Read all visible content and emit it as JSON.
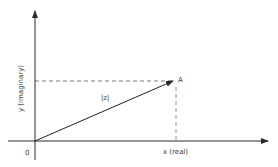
{
  "diagram": {
    "origin_label": "0",
    "x_axis_label": "x (real)",
    "y_axis_label": "y (imaginary)",
    "point_label": "A",
    "vector_label": "|z|",
    "colors": {
      "axis": "#2b2b2b",
      "vector": "#1f1f1f",
      "dashed": "#555555",
      "text": "#3a3a3a",
      "background": "#ffffff"
    }
  }
}
